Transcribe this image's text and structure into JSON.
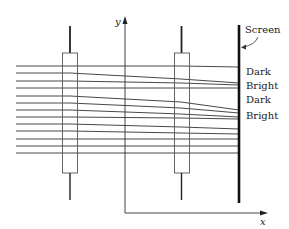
{
  "figure": {
    "type": "atom-interferometer-schematic",
    "labels": {
      "screen": "Screen",
      "fringes": [
        "Dark",
        "Bright",
        "Dark",
        "Bright"
      ],
      "x_axis": "x",
      "y_axis": "y"
    },
    "colors": {
      "ink": "#222222",
      "box": "#555555",
      "background": "#ffffff"
    },
    "geometry": {
      "ray_start_x": 16,
      "lens1_x": 70,
      "lens2_x": 181,
      "screen_x": 239,
      "rays": [
        {
          "y0": 66,
          "y1": 66,
          "y2": 67
        },
        {
          "y0": 73,
          "y1": 79,
          "y2": 83
        },
        {
          "y0": 81,
          "y1": 83,
          "y2": 85
        },
        {
          "y0": 88,
          "y1": 88,
          "y2": 88
        },
        {
          "y0": 96,
          "y1": 102,
          "y2": 110
        },
        {
          "y0": 103,
          "y1": 108,
          "y2": 113
        },
        {
          "y0": 110,
          "y1": 114,
          "y2": 117
        },
        {
          "y0": 117,
          "y1": 118,
          "y2": 119
        },
        {
          "y0": 124,
          "y1": 127,
          "y2": 129
        },
        {
          "y0": 131,
          "y1": 133,
          "y2": 134
        },
        {
          "y0": 139,
          "y1": 139,
          "y2": 139
        },
        {
          "y0": 146,
          "y1": 146,
          "y2": 146
        },
        {
          "y0": 153,
          "y1": 153,
          "y2": 153
        }
      ]
    }
  }
}
